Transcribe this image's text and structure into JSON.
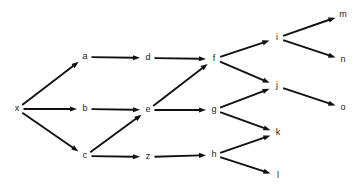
{
  "diagram": {
    "type": "directed-graph",
    "background_color": "#ffffff",
    "edge_color": "#111111",
    "label_color": "#1a1a1a",
    "width": 362,
    "height": 190,
    "nodes": [
      {
        "id": "x",
        "label": "x",
        "x": 17,
        "y": 109
      },
      {
        "id": "a",
        "label": "a",
        "x": 85,
        "y": 57
      },
      {
        "id": "b",
        "label": "b",
        "x": 85,
        "y": 109
      },
      {
        "id": "c",
        "label": "c",
        "x": 85,
        "y": 156
      },
      {
        "id": "d",
        "label": "d",
        "x": 148,
        "y": 58
      },
      {
        "id": "e",
        "label": "e",
        "x": 148,
        "y": 110
      },
      {
        "id": "z",
        "label": "z",
        "x": 148,
        "y": 157
      },
      {
        "id": "f",
        "label": "f",
        "x": 214,
        "y": 59
      },
      {
        "id": "g",
        "label": "g",
        "x": 214,
        "y": 110
      },
      {
        "id": "h",
        "label": "h",
        "x": 214,
        "y": 155
      },
      {
        "id": "i",
        "label": "i",
        "x": 277,
        "y": 38
      },
      {
        "id": "j",
        "label": "j",
        "x": 277,
        "y": 86
      },
      {
        "id": "k",
        "label": "k",
        "x": 278,
        "y": 133
      },
      {
        "id": "l",
        "label": "l",
        "x": 278,
        "y": 176
      },
      {
        "id": "m",
        "label": "m",
        "x": 343,
        "y": 15
      },
      {
        "id": "n",
        "label": "n",
        "x": 343,
        "y": 60
      },
      {
        "id": "o",
        "label": "o",
        "x": 343,
        "y": 108
      }
    ],
    "edges": [
      {
        "from": "x",
        "to": "a"
      },
      {
        "from": "x",
        "to": "b"
      },
      {
        "from": "x",
        "to": "c"
      },
      {
        "from": "a",
        "to": "d"
      },
      {
        "from": "b",
        "to": "e"
      },
      {
        "from": "c",
        "to": "e"
      },
      {
        "from": "c",
        "to": "z"
      },
      {
        "from": "d",
        "to": "f"
      },
      {
        "from": "e",
        "to": "f"
      },
      {
        "from": "e",
        "to": "g"
      },
      {
        "from": "z",
        "to": "h"
      },
      {
        "from": "f",
        "to": "i"
      },
      {
        "from": "f",
        "to": "j"
      },
      {
        "from": "g",
        "to": "j"
      },
      {
        "from": "g",
        "to": "k"
      },
      {
        "from": "h",
        "to": "k"
      },
      {
        "from": "h",
        "to": "l"
      },
      {
        "from": "i",
        "to": "m"
      },
      {
        "from": "i",
        "to": "n"
      },
      {
        "from": "j",
        "to": "o"
      }
    ]
  }
}
